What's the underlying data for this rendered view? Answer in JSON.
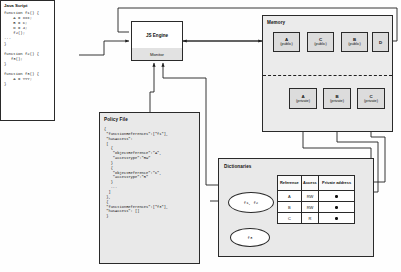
{
  "javascript_panel": {
    "title": "Java Script",
    "code": "function f1() {\n    A = xxx;\n    B = C;\n    D = 4;\n    f2();\n...\n}\n\nfunction f2() {\n   f3();\n}\n\nfunction f3() {\n    A = YYY;\n}"
  },
  "engine": {
    "title": "JS Engine",
    "monitor_label": "Monitor"
  },
  "memory": {
    "title": "Memory",
    "public_cells": [
      {
        "name": "A",
        "qualifier": "(public)"
      },
      {
        "name": "C",
        "qualifier": "(public)"
      },
      {
        "name": "B",
        "qualifier": "(public)"
      },
      {
        "name": "D",
        "qualifier": ""
      }
    ],
    "private_cells": [
      {
        "name": "A",
        "qualifier": "(private)"
      },
      {
        "name": "B",
        "qualifier": "(private)"
      },
      {
        "name": "C",
        "qualifier": "(private)"
      }
    ]
  },
  "policy_file": {
    "title": "Policy File",
    "code": "{\n \"functionReferences\":[\"f1\"],\n \"hasAccess\":\n [\n   {\n    \"objectReference\":\"A\",\n    \"accessType\":\"RW\"\n   }\n   {\n    \"objectReference\":\"C\",\n    \"accessType\":\"R\"\n   }\n   ...\n  ]\n },\n {\n \"functionReferences\":[\"f3\"],\n \"hasAccess\": []\n }"
  },
  "dictionaries": {
    "title": "Dictionaries",
    "nodes": [
      {
        "label": "f1, f2"
      },
      {
        "label": "f3"
      }
    ],
    "table": {
      "headers": [
        "Reference",
        "Access",
        "Private address"
      ],
      "rows": [
        {
          "reference": "A",
          "access": "RW",
          "private_address": "●"
        },
        {
          "reference": "B",
          "access": "RW",
          "private_address": "●"
        },
        {
          "reference": "C",
          "access": "R",
          "private_address": "●"
        }
      ]
    }
  },
  "colors": {
    "stroke": "#2a2a2a",
    "panel_fill": "#e9e9e9",
    "cell_fill": "#dcdcdc",
    "monitor_fill": "#e2e2e2"
  }
}
